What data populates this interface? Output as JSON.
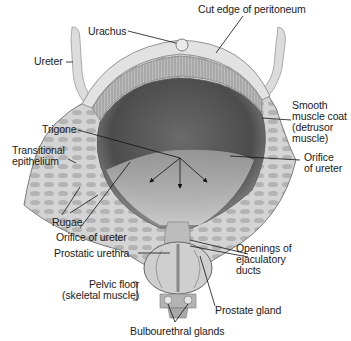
{
  "figure": {
    "colors": {
      "background": "#ffffff",
      "tissue_light": "#d8d8d8",
      "tissue_mid": "#a9a9a9",
      "lumen_dark": "#5a5a5a",
      "line": "#1a1a1a"
    }
  },
  "labels": {
    "urachus": "Urachus",
    "cut_edge": "Cut edge of peritoneum",
    "ureter": "Ureter",
    "smooth_muscle": "Smooth\nmuscle coat\n(detrusor\nmuscle)",
    "trigone": "Trigone",
    "transitional": "Transitional\nepithelium",
    "orifice_right": "Orifice\nof ureter",
    "rugae": "Rugae",
    "orifice_left": "Orifice of ureter",
    "prostatic_urethra": "Prostatic urethra",
    "openings": "Openings of\nejaculatory\nducts",
    "pelvic_floor": "Pelvic floor\n(skeletal muscle)",
    "prostate": "Prostate gland",
    "bulbourethral": "Bulbourethral glands"
  }
}
